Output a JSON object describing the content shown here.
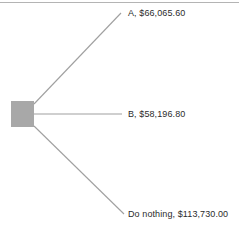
{
  "diagram": {
    "type": "decision-tree",
    "canvas": {
      "width": 239,
      "height": 229,
      "background": "#ffffff"
    },
    "colors": {
      "node_fill": "#a8a8a8",
      "branch_line": "#a0a0a0",
      "top_rule": "#b4b4b4",
      "text": "#2b2b2b"
    },
    "top_rule": {
      "y": 2.5,
      "x1": 0,
      "x2": 239
    },
    "decision_node": {
      "shape": "square",
      "x": 11,
      "y": 101,
      "width": 23,
      "height": 26,
      "fill": "#a8a8a8"
    },
    "origin": {
      "x": 34,
      "y": 114
    },
    "branches": [
      {
        "id": "a",
        "label": "A, $66,065.60",
        "option": "A",
        "value": "$66,065.60",
        "amount": 66065.6,
        "from": {
          "x": 34,
          "y": 104
        },
        "to": {
          "x": 121,
          "y": 13
        }
      },
      {
        "id": "b",
        "label": "B, $58,196.80",
        "option": "B",
        "value": "$58,196.80",
        "amount": 58196.8,
        "from": {
          "x": 34,
          "y": 114
        },
        "to": {
          "x": 122,
          "y": 114
        }
      },
      {
        "id": "do-nothing",
        "label": "Do nothing, $113,730.00",
        "option": "Do nothing",
        "value": "$113,730.00",
        "amount": 113730.0,
        "from": {
          "x": 34,
          "y": 126
        },
        "to": {
          "x": 124,
          "y": 214
        }
      }
    ]
  }
}
